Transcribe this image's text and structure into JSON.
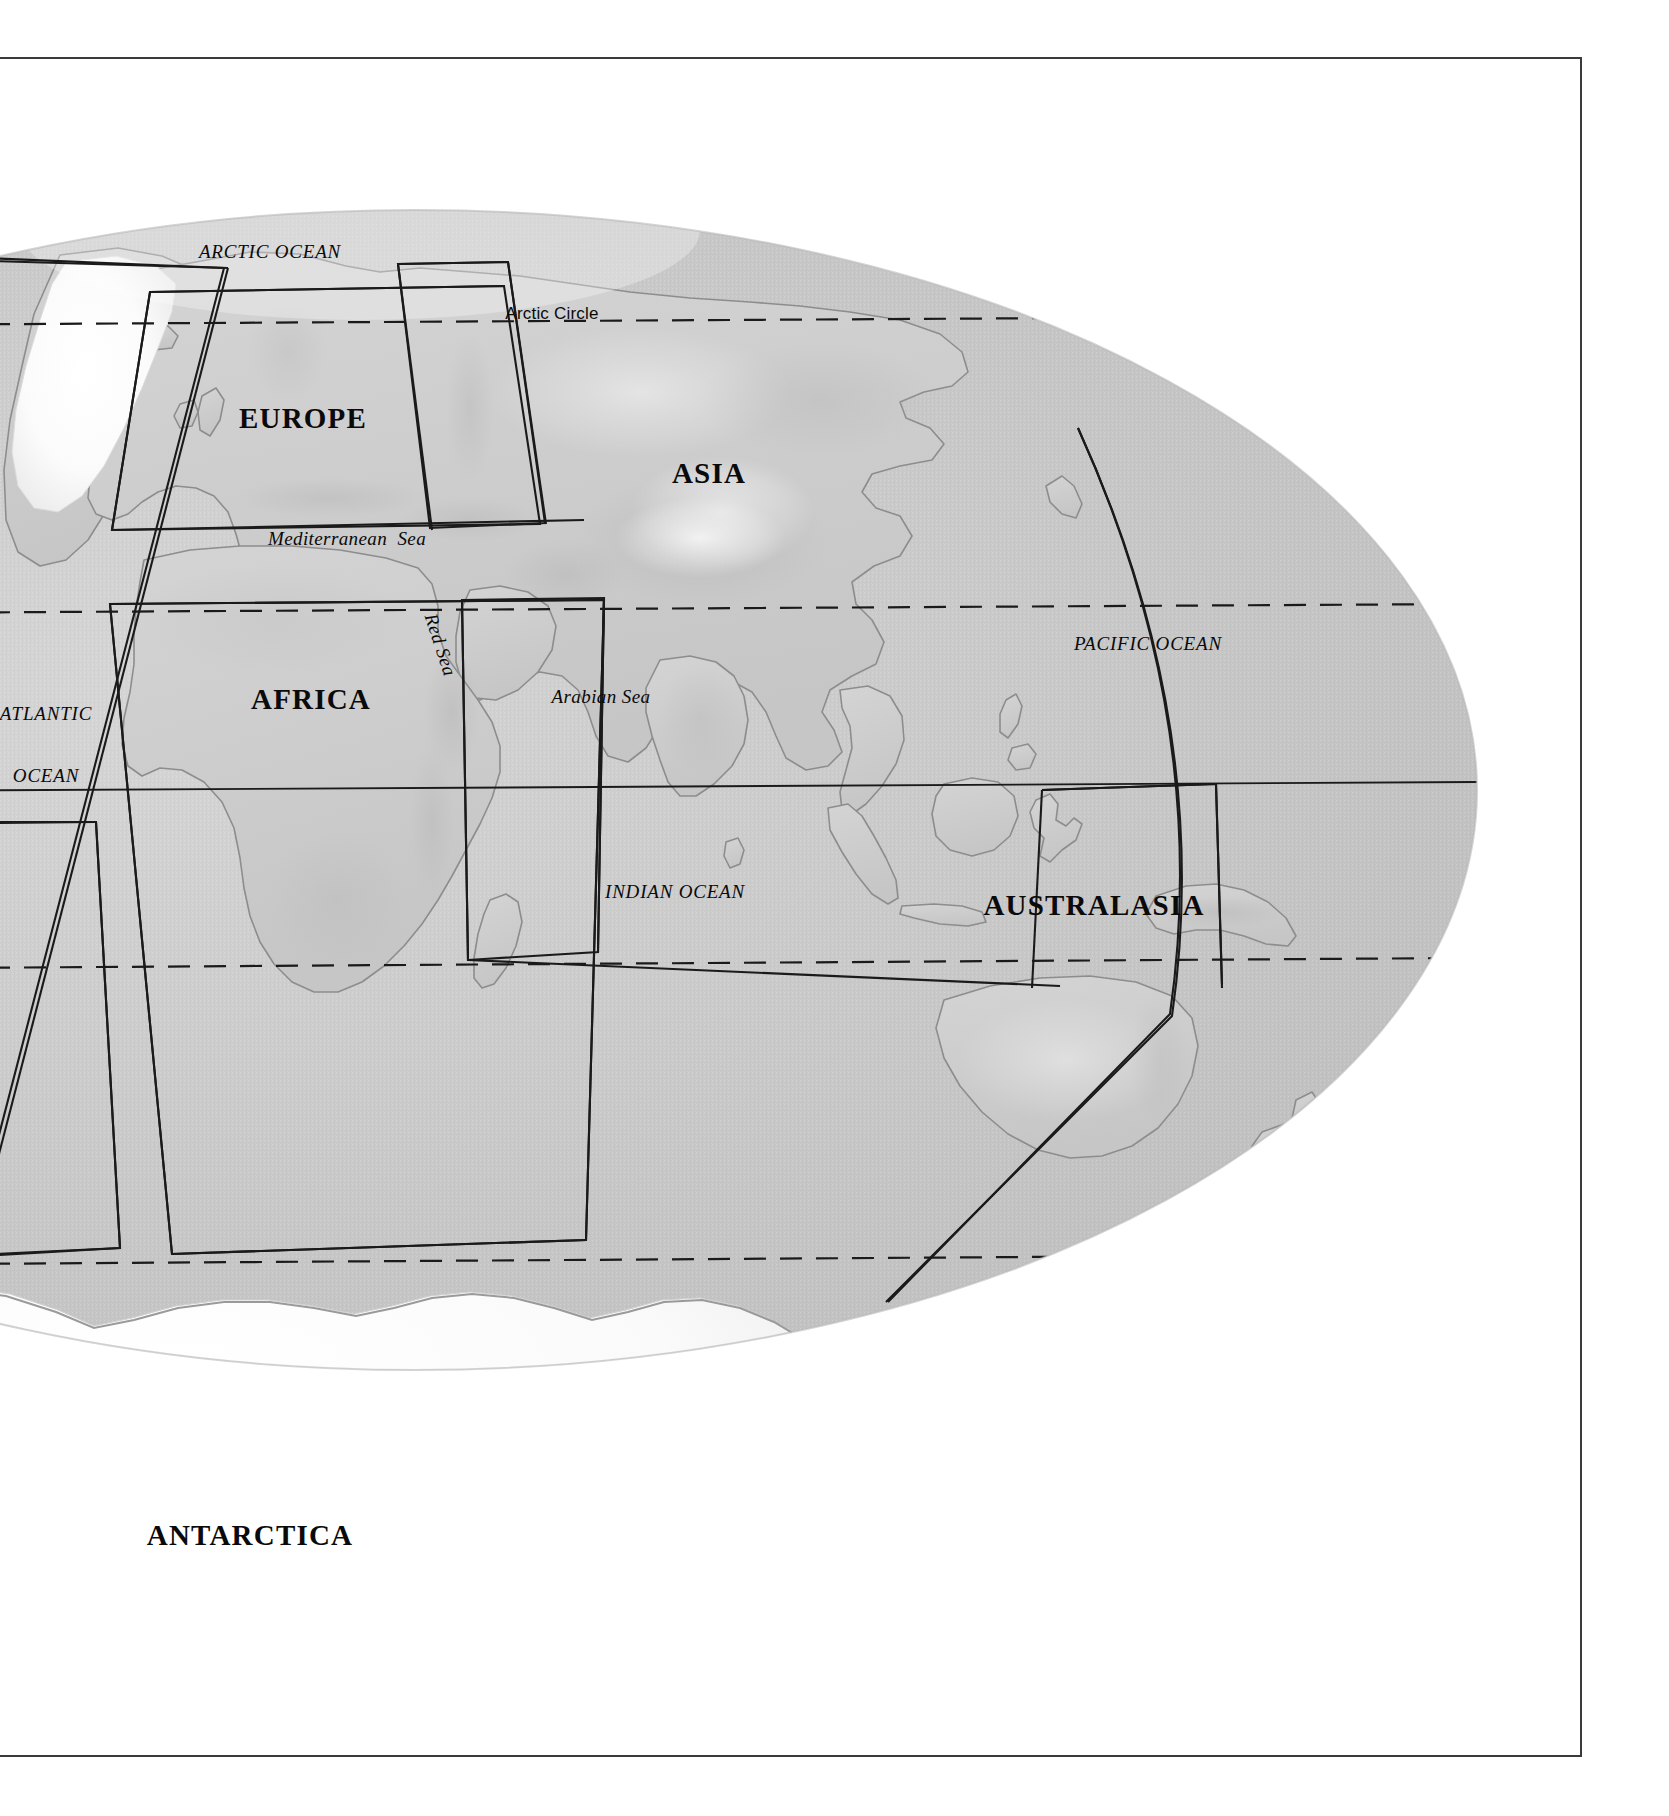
{
  "page": {
    "kind": "atlas-world-index-map",
    "background_color": "#ffffff",
    "frame_color": "#3a3a3a"
  },
  "map": {
    "projection": "oval / elliptical world projection",
    "ocean_fill": "#c9c9c9",
    "land_fill": "#cfcfcf",
    "coast_stroke": "#8a8a8a",
    "grid_stroke": "#1a1a1a",
    "ice_fill": "#f6f6f6",
    "continents": [
      {
        "id": "europe",
        "label": "EUROPE",
        "x": 303,
        "y": 419
      },
      {
        "id": "asia",
        "label": "ASIA",
        "x": 709,
        "y": 474
      },
      {
        "id": "africa",
        "label": "AFRICA",
        "x": 311,
        "y": 700
      },
      {
        "id": "australasia",
        "label": "AUSTRALASIA",
        "x": 1094,
        "y": 906
      },
      {
        "id": "antarctica",
        "label": "ANTARCTICA",
        "x": 250,
        "y": 1536
      }
    ],
    "oceans": [
      {
        "id": "arctic-ocean",
        "label": "ARCTIC OCEAN",
        "x": 270,
        "y": 252,
        "lines": [
          "ARCTIC OCEAN"
        ]
      },
      {
        "id": "atlantic-ocean",
        "label": "ATLANTIC OCEAN",
        "x": 46,
        "y": 745,
        "lines": [
          "ATLANTIC",
          "OCEAN"
        ]
      },
      {
        "id": "indian-ocean",
        "label": "INDIAN OCEAN",
        "x": 675,
        "y": 892,
        "lines": [
          "INDIAN OCEAN"
        ]
      },
      {
        "id": "pacific-ocean",
        "label": "PACIFIC OCEAN",
        "x": 1148,
        "y": 644,
        "lines": [
          "PACIFIC OCEAN"
        ]
      }
    ],
    "seas": [
      {
        "id": "mediterranean-sea",
        "label": "Mediterranean  Sea",
        "x": 347,
        "y": 539,
        "rotation": 0
      },
      {
        "id": "red-sea",
        "label": "Red Sea",
        "x": 440,
        "y": 645,
        "rotation": 72
      },
      {
        "id": "arabian-sea",
        "label": "Arabian Sea",
        "x": 601,
        "y": 697,
        "rotation": 0
      }
    ],
    "latitude_lines": [
      {
        "id": "arctic-circle",
        "label": "Arctic Circle",
        "label_x": 552,
        "label_y": 314,
        "style": "dashed",
        "y_left": 322,
        "y_right": 318
      },
      {
        "id": "tropic-of-cancer",
        "label": "",
        "style": "dashed",
        "y_left": 611,
        "y_right": 607
      },
      {
        "id": "equator",
        "label": "",
        "style": "solid",
        "y_left": 789,
        "y_right": 783
      },
      {
        "id": "tropic-of-capricorn",
        "label": "",
        "style": "dashed",
        "y_left": 967,
        "y_right": 961
      },
      {
        "id": "antarctic-circle",
        "label": "",
        "style": "dashed",
        "y_left": 1263,
        "y_right": 1258
      }
    ],
    "index_boxes": [
      {
        "id": "index-box-northern-europe",
        "description": "map-sheet outline over northern Europe / Scandinavia"
      },
      {
        "id": "index-box-europe",
        "description": "map-sheet outline over Europe and the Mediterranean"
      },
      {
        "id": "index-box-africa",
        "description": "map-sheet outline over Africa and the Middle East"
      },
      {
        "id": "index-box-north-atlantic",
        "description": "map-sheet outline over the North Atlantic / Greenland"
      },
      {
        "id": "index-box-south-atlantic",
        "description": "map-sheet outline over the South Atlantic"
      },
      {
        "id": "index-box-asia",
        "description": "map-sheet outline over Asia"
      },
      {
        "id": "index-box-australasia",
        "description": "map-sheet outline over Australasia and the SW Pacific"
      },
      {
        "id": "index-box-east-indies",
        "description": "map-sheet outline over the East Indies / Philippines"
      }
    ]
  }
}
